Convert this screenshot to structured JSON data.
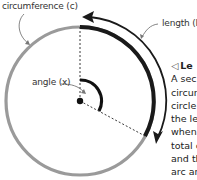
{
  "labels": {
    "circumference": "circumference (c)",
    "length": "length (l)",
    "angle": "angle (x)"
  },
  "sidebar_text": {
    "marker": "◁",
    "heading": "Le",
    "lines": [
      "A sec",
      "circur",
      "circle",
      "the le",
      "when",
      "total c",
      "and th",
      "arc ar"
    ]
  },
  "colors": {
    "circle": "#9a9a9a",
    "arc": "#1a1a1a",
    "text": "#333333"
  }
}
